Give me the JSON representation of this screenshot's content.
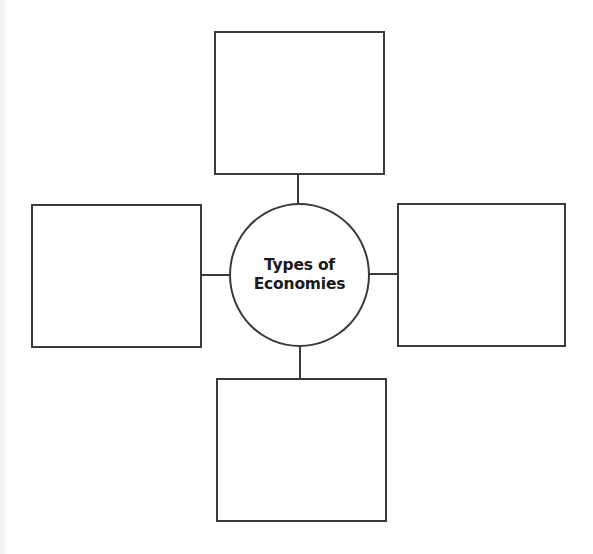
{
  "diagram": {
    "type": "concept-web",
    "center": {
      "title_line1": "Types of",
      "title_line2": "Economies"
    },
    "boxes": [
      {
        "position": "top",
        "text": ""
      },
      {
        "position": "left",
        "text": ""
      },
      {
        "position": "right",
        "text": ""
      },
      {
        "position": "bottom",
        "text": ""
      }
    ],
    "colors": {
      "stroke": "#3a3a3a",
      "background": "#ffffff",
      "text": "#1a1a1a"
    }
  }
}
